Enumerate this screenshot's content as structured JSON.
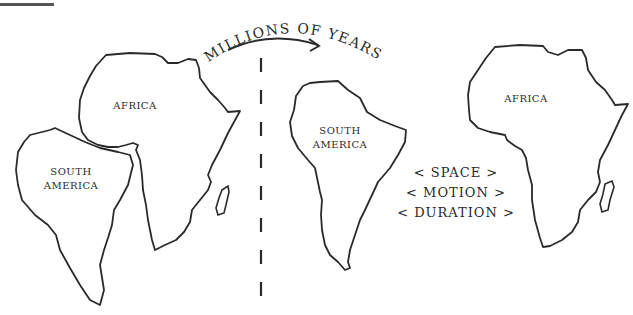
{
  "diagram": {
    "caption": "Millions of years",
    "caption_display": "MILLIONS OF YEARS",
    "before": {
      "continents": [
        {
          "name": "Africa",
          "label": "AFRICA"
        },
        {
          "name": "South America",
          "label": "SOUTH\nAMERICA"
        }
      ]
    },
    "after": {
      "continents": [
        {
          "name": "South America",
          "label": "SOUTH\nAMERICA"
        },
        {
          "name": "Africa",
          "label": "AFRICA"
        }
      ],
      "properties": [
        "< SPACE >",
        "< MOTION >",
        "< DURATION >"
      ]
    },
    "colors": {
      "stroke": "#2a2a2a",
      "background": "#ffffff"
    }
  }
}
